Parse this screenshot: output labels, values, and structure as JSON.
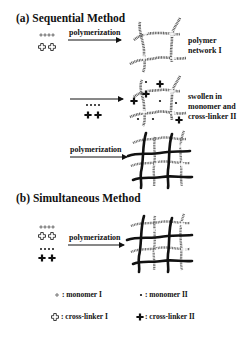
{
  "figure": {
    "section_a": {
      "title": "(a) Sequential Method",
      "step1": {
        "reactants": [
          "monomer I",
          "cross-linker I"
        ],
        "arrow_label": "polymerization",
        "product_label_line1": "polymer",
        "product_label_line2": "network I"
      },
      "step2": {
        "reactants": [
          "monomer II",
          "cross-linker II"
        ],
        "arrow_label": "",
        "product_label_line1": "swollen in",
        "product_label_line2": "monomer and",
        "product_label_line3": "cross-linker II"
      },
      "step3": {
        "arrow_label": "polymerization",
        "product": "interpenetrating network"
      }
    },
    "section_b": {
      "title": "(b) Simultaneous Method",
      "reactants": [
        "monomer I",
        "cross-linker I",
        "monomer II",
        "cross-linker II"
      ],
      "arrow_label": "polymerization",
      "product": "interpenetrating network"
    },
    "legend": {
      "monomer_1": ": monomer I",
      "monomer_2": ": monomer II",
      "crosslinker_1": ": cross-linker I",
      "crosslinker_2": ": cross-linker II"
    },
    "colors": {
      "ink": "#111111",
      "background": "#ffffff"
    }
  }
}
